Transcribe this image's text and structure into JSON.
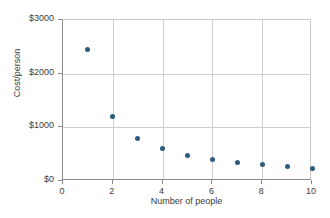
{
  "chart_data": {
    "type": "scatter",
    "title": "",
    "xlabel": "Number of people",
    "ylabel": "Cost/person",
    "xlim": [
      0,
      10
    ],
    "ylim": [
      0,
      3000
    ],
    "grid": true,
    "legend": "none",
    "xticks": [
      "0",
      "2",
      "4",
      "6",
      "8",
      "10"
    ],
    "xtick_values": [
      0,
      2,
      4,
      6,
      8,
      10
    ],
    "yticks": [
      "$0",
      "$1000",
      "$2000",
      "$3000"
    ],
    "ytick_values": [
      0,
      1000,
      2000,
      3000
    ],
    "series": [
      {
        "name": "Cost per person",
        "color": "#2e5c7e",
        "marker": "circle",
        "x": [
          1,
          2,
          3,
          4,
          5,
          6,
          7,
          8,
          9,
          10
        ],
        "values": [
          2450,
          1200,
          800,
          600,
          480,
          400,
          350,
          300,
          270,
          240
        ]
      }
    ]
  },
  "axes": {
    "x_axis_title": "Number of people",
    "y_axis_title": "Cost/person"
  },
  "colors": {
    "marker": "#2e5c7e",
    "grid": "#cfcfcf",
    "axis": "#8a8a8a",
    "frame": "#c9c9c9",
    "text": "#3b3b3b",
    "background": "#ffffff"
  }
}
